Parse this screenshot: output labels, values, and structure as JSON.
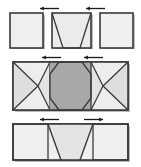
{
  "diagram": {
    "canvas": {
      "width": 141,
      "height": 167,
      "background": "#ffffff"
    },
    "palette": {
      "outline": "#3a3a3a",
      "fold_line": "#3a3a3a",
      "panel_light": "#f0f0f0",
      "panel_mid": "#e2e2e2",
      "panel_shade": "#d6d6d6",
      "panel_dark": "#a8a8a8",
      "arrow": "#1a1a1a",
      "shadow": "#bdbdbd"
    },
    "stroke": {
      "outline_width": 1.6,
      "fold_width": 1.2,
      "arrow_width": 1.3
    },
    "stages": [
      {
        "id": "stage-stowed",
        "label": "Stowed configuration",
        "order": 1,
        "y_top": 13,
        "y_bottom": 48,
        "panels": [
          {
            "id": "left-square",
            "name": "left-end-panel",
            "x": 10,
            "width": 33,
            "fill": "#efefef",
            "shape": "square"
          },
          {
            "id": "center-trapezoid",
            "name": "center-fold-panel",
            "x": 52,
            "width": 39,
            "fill": "#ebebeb",
            "shape": "trapezoid-down"
          },
          {
            "id": "right-square",
            "name": "right-end-panel",
            "x": 100,
            "width": 33,
            "fill": "#efefef",
            "shape": "square"
          }
        ],
        "arrows": [
          {
            "id": "arrow-left",
            "name": "motion-arrow-left",
            "x": 40,
            "y": 8,
            "length": 19,
            "direction": "left"
          },
          {
            "id": "arrow-right",
            "name": "motion-arrow-right",
            "x": 86,
            "y": 8,
            "length": 19,
            "direction": "left"
          }
        ]
      },
      {
        "id": "stage-intermediate",
        "label": "Intermediate configuration",
        "order": 2,
        "y_top": 62,
        "y_bottom": 110,
        "panels": [
          {
            "id": "left-wing",
            "name": "left-wing-panel",
            "x": 13,
            "width": 37,
            "fill": "#e4e4e4",
            "shape": "bowtie-left"
          },
          {
            "id": "center-octagon",
            "name": "center-core-panel",
            "x": 50,
            "width": 41,
            "fill": "#a8a8a8",
            "shape": "octagon"
          },
          {
            "id": "right-wing",
            "name": "right-wing-panel",
            "x": 91,
            "width": 37,
            "fill": "#e4e4e4",
            "shape": "bowtie-right"
          }
        ],
        "arrows": [
          {
            "id": "arrow-left",
            "name": "motion-arrow-left",
            "x": 42,
            "y": 57,
            "length": 19,
            "direction": "left"
          },
          {
            "id": "arrow-right",
            "name": "motion-arrow-right",
            "x": 84,
            "y": 57,
            "length": 19,
            "direction": "left"
          }
        ]
      },
      {
        "id": "stage-deployed",
        "label": "Deployed configuration",
        "order": 3,
        "y_top": 124,
        "y_bottom": 160,
        "panels": [
          {
            "id": "left-flat",
            "name": "left-flat-panel",
            "x": 13,
            "width": 35,
            "fill": "#efefef",
            "shape": "rectangle"
          },
          {
            "id": "center-trapezoid-up",
            "name": "center-flat-panel",
            "x": 48,
            "width": 45,
            "fill": "#e8e8e8",
            "shape": "trapezoid-up"
          },
          {
            "id": "right-flat",
            "name": "right-flat-panel",
            "x": 93,
            "width": 35,
            "fill": "#efefef",
            "shape": "rectangle"
          }
        ],
        "arrows": [
          {
            "id": "arrow-left",
            "name": "motion-arrow-left",
            "x": 40,
            "y": 119,
            "length": 19,
            "direction": "left"
          },
          {
            "id": "arrow-right",
            "name": "motion-arrow-right",
            "x": 84,
            "y": 119,
            "length": 19,
            "direction": "right"
          }
        ]
      }
    ]
  }
}
